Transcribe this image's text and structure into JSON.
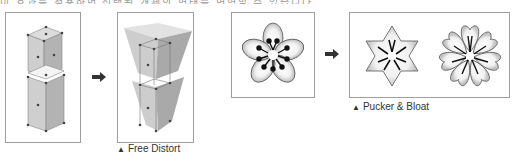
{
  "top_text_cutoff": "이 효과를 적용하면 선택된 개체의 형태를 변형할 수 있습니다",
  "figures": [
    {
      "id": "free-distort",
      "caption": "Free Distort",
      "caption_marker": "▲",
      "before_label": "original column",
      "after_label": "distorted column"
    },
    {
      "id": "pucker-bloat",
      "caption": "Pucker & Bloat",
      "caption_marker": "▲",
      "before_label": "original flower",
      "after_labels": [
        "pucker star",
        "bloat flower"
      ]
    }
  ],
  "colors": {
    "frame": "#9e9e9e",
    "arrow": "#333333",
    "box_face": "#c9c9c9",
    "box_side": "#a8a8a8",
    "outline": "#555555"
  }
}
